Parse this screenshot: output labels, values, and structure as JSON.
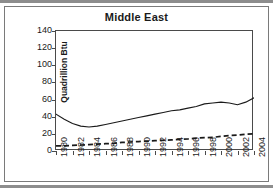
{
  "chart_data": {
    "type": "line",
    "title": "Middle East",
    "xlabel": "",
    "ylabel": "Quadrillion Btu",
    "ylim": [
      0,
      140
    ],
    "ytick_values": [
      140,
      120,
      100,
      80,
      60,
      40,
      20,
      0
    ],
    "ytick_labels": [
      "140",
      "120",
      "100",
      "80",
      "60",
      "40",
      "20",
      "0"
    ],
    "xlim": [
      1980,
      2004
    ],
    "xtick_values": [
      1980,
      1982,
      1984,
      1986,
      1988,
      1990,
      1992,
      1994,
      1996,
      1998,
      2000,
      2002,
      2004
    ],
    "xtick_labels": [
      "1980",
      "1982",
      "1984",
      "1986",
      "1988",
      "1990",
      "1992",
      "1994",
      "1996",
      "1998",
      "2000",
      "2002",
      "2004"
    ],
    "grid": false,
    "legend": "none",
    "x": [
      1980,
      1981,
      1982,
      1983,
      1984,
      1985,
      1986,
      1987,
      1988,
      1989,
      1990,
      1991,
      1992,
      1993,
      1994,
      1995,
      1996,
      1997,
      1998,
      1999,
      2000,
      2001,
      2002,
      2003,
      2004
    ],
    "series": [
      {
        "name": "solid-series",
        "style": "solid",
        "color": "#1a1a1a",
        "values": [
          43,
          37,
          32,
          29,
          28,
          29,
          31,
          33,
          35,
          37,
          39,
          41,
          43,
          45,
          47,
          48,
          50,
          52,
          55,
          56,
          57,
          56,
          54,
          57,
          62
        ]
      },
      {
        "name": "dashed-series",
        "style": "dashed",
        "color": "#1a1a1a",
        "values": [
          6,
          6,
          6.5,
          7,
          7.5,
          8,
          8.5,
          9,
          10,
          10.5,
          11,
          11.5,
          12,
          12.5,
          13,
          13.5,
          14,
          15,
          15.5,
          16,
          17,
          18,
          18.5,
          19.5,
          20
        ]
      }
    ]
  },
  "colors": {
    "line": "#1a1a1a",
    "axis": "#4a4a4a",
    "frame": "#7a7a7a",
    "rule": "#8d8d8d",
    "background": "#ffffff"
  }
}
